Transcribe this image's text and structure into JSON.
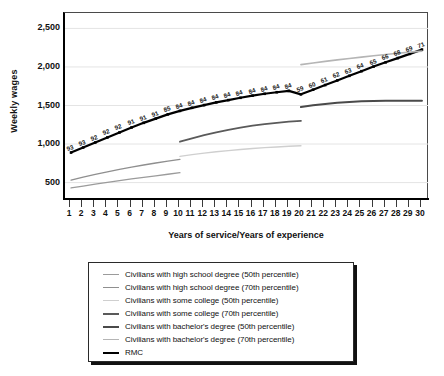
{
  "chart_data": {
    "type": "line",
    "title": "",
    "xlabel": "Years of service/Years of experience",
    "ylabel": "Weekly wages",
    "xlim": [
      0.5,
      30.5
    ],
    "ylim": [
      300,
      2700
    ],
    "grid": "horizontal",
    "legend_position": "below-chart",
    "yticks": [
      "500",
      "1,000",
      "1,500",
      "2,000",
      "2,500"
    ],
    "ytick_values": [
      500,
      1000,
      1500,
      2000,
      2500
    ],
    "xticks": [
      "1",
      "2",
      "3",
      "4",
      "5",
      "6",
      "7",
      "8",
      "9",
      "10",
      "11",
      "12",
      "13",
      "14",
      "15",
      "16",
      "17",
      "18",
      "19",
      "20",
      "21",
      "22",
      "23",
      "24",
      "25",
      "26",
      "27",
      "28",
      "29",
      "30"
    ],
    "x": [
      1,
      2,
      3,
      4,
      5,
      6,
      7,
      8,
      9,
      10,
      11,
      12,
      13,
      14,
      15,
      16,
      17,
      18,
      19,
      20,
      21,
      22,
      23,
      24,
      25,
      26,
      27,
      28,
      29,
      30
    ],
    "series": [
      {
        "name": "RMC",
        "color": "#000000",
        "width": 2.2,
        "markers": true,
        "values": [
          890,
          955,
          1020,
          1085,
          1150,
          1215,
          1275,
          1330,
          1385,
          1430,
          1470,
          1505,
          1540,
          1570,
          1600,
          1628,
          1652,
          1672,
          1690,
          1645,
          1705,
          1765,
          1825,
          1885,
          1945,
          2005,
          2060,
          2115,
          2170,
          2225
        ],
        "point_labels": [
          "93",
          "93",
          "92",
          "92",
          "92",
          "91",
          "91",
          "91",
          "85",
          "84",
          "84",
          "84",
          "84",
          "84",
          "84",
          "84",
          "84",
          "84",
          "84",
          "59",
          "60",
          "61",
          "62",
          "63",
          "64",
          "65",
          "66",
          "68",
          "69",
          "71"
        ]
      },
      {
        "name": "Civilians with high school degree (50th percentile)",
        "color": "#9b9b9b",
        "width": 1.3,
        "markers": false,
        "segment": "1-10",
        "x": [
          1,
          2,
          3,
          4,
          5,
          6,
          7,
          8,
          9,
          10
        ],
        "values": [
          430,
          455,
          480,
          503,
          525,
          548,
          568,
          588,
          608,
          628
        ]
      },
      {
        "name": "Civilians with high school degree (70th percentile)",
        "color": "#8f8f8f",
        "width": 1.3,
        "markers": false,
        "segment": "1-10",
        "x": [
          1,
          2,
          3,
          4,
          5,
          6,
          7,
          8,
          9,
          10
        ],
        "values": [
          532,
          570,
          606,
          640,
          672,
          700,
          728,
          754,
          778,
          800
        ]
      },
      {
        "name": "Civilians with some college (50th percentile)",
        "color": "#cfcfcf",
        "width": 1.4,
        "markers": false,
        "segment": "10-20",
        "x": [
          10,
          11,
          12,
          13,
          14,
          15,
          16,
          17,
          18,
          19,
          20
        ],
        "values": [
          840,
          862,
          882,
          900,
          915,
          930,
          942,
          953,
          962,
          971,
          978
        ]
      },
      {
        "name": "Civilians with some college (70th percentile)",
        "color": "#5a5a5a",
        "width": 1.8,
        "markers": false,
        "segment": "10-20",
        "x": [
          10,
          11,
          12,
          13,
          14,
          15,
          16,
          17,
          18,
          19,
          20
        ],
        "values": [
          1030,
          1075,
          1115,
          1152,
          1185,
          1213,
          1238,
          1258,
          1275,
          1290,
          1300
        ]
      },
      {
        "name": "Civilians with bachelor's degree (50th percentile)",
        "color": "#4a4a4a",
        "width": 2.0,
        "markers": false,
        "segment": "20-30",
        "x": [
          20,
          21,
          22,
          23,
          24,
          25,
          26,
          27,
          28,
          29,
          30
        ],
        "values": [
          1480,
          1502,
          1520,
          1535,
          1547,
          1554,
          1559,
          1562,
          1563,
          1563,
          1562
        ]
      },
      {
        "name": "Civilians with bachelor's degree (70th percentile)",
        "color": "#b5b5b5",
        "width": 1.6,
        "markers": false,
        "segment": "20-30",
        "x": [
          20,
          21,
          22,
          23,
          24,
          25,
          26,
          27,
          28,
          29,
          30
        ],
        "values": [
          2030,
          2052,
          2072,
          2092,
          2110,
          2128,
          2145,
          2162,
          2178,
          2192,
          2205
        ]
      }
    ]
  },
  "legend": {
    "items": [
      {
        "label": "Civilians with high school degree (50th percentile)",
        "color": "#9b9b9b",
        "width": 1.6
      },
      {
        "label": "Civilians with high school degree (70th percentile)",
        "color": "#8f8f8f",
        "width": 1.6
      },
      {
        "label": "Civilians with some college (50th percentile)",
        "color": "#cfcfcf",
        "width": 1.6
      },
      {
        "label": "Civilians with some college (70th percentile)",
        "color": "#5a5a5a",
        "width": 2.0
      },
      {
        "label": "Civilians with bachelor's degree (50th percentile)",
        "color": "#4a4a4a",
        "width": 2.4
      },
      {
        "label": "Civilians with bachelor's degree (70th percentile)",
        "color": "#b5b5b5",
        "width": 1.8
      },
      {
        "label": "RMC",
        "color": "#000000",
        "width": 2.6
      }
    ]
  }
}
